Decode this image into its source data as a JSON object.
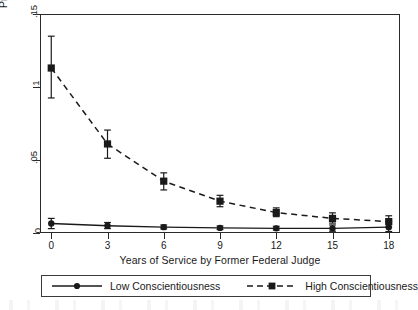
{
  "chart_data": {
    "type": "line",
    "title": "",
    "xlabel": "Years of Service by Former Federal Judge",
    "ylabel": "Predicted Probability of Recusal",
    "x": [
      0,
      3,
      6,
      9,
      12,
      15,
      18
    ],
    "xlim": [
      -0.6,
      18.6
    ],
    "ylim": [
      0,
      0.15
    ],
    "xticks": [
      "0",
      "3",
      "6",
      "9",
      "12",
      "15",
      "18"
    ],
    "yticks": [
      "0",
      ".05",
      ".1",
      ".15"
    ],
    "ytick_values": [
      0,
      0.05,
      0.1,
      0.15
    ],
    "grid": false,
    "legend_position": "bottom-outside",
    "series": [
      {
        "name": "Low Conscientiousness",
        "marker": "circle",
        "linestyle": "solid",
        "color": "#1a1a1a",
        "values": [
          0.0065,
          0.005,
          0.004,
          0.0035,
          0.0032,
          0.0032,
          0.004
        ],
        "ci_low": [
          0.003,
          0.003,
          0.0028,
          0.0024,
          0.002,
          0.0012,
          0.001
        ],
        "ci_high": [
          0.01,
          0.0072,
          0.0055,
          0.0048,
          0.0046,
          0.0055,
          0.0078
        ]
      },
      {
        "name": "High Conscientiousness",
        "marker": "square",
        "linestyle": "dashed",
        "color": "#1a1a1a",
        "values": [
          0.113,
          0.061,
          0.0355,
          0.0218,
          0.014,
          0.01,
          0.0078
        ],
        "ci_low": [
          0.0925,
          0.0512,
          0.0295,
          0.018,
          0.0112,
          0.0068,
          0.0042
        ],
        "ci_high": [
          0.1348,
          0.0705,
          0.0412,
          0.0258,
          0.0172,
          0.0138,
          0.0118
        ]
      }
    ]
  },
  "legend": {
    "entries": [
      {
        "label": "Low Conscientiousness",
        "key": "solid-circle-key"
      },
      {
        "label": "High Conscientiousness",
        "key": "dashed-square-key"
      }
    ]
  },
  "colors": {
    "ink": "#1a1a1a",
    "frame": "#2b2b2b",
    "background": "#ffffff"
  }
}
